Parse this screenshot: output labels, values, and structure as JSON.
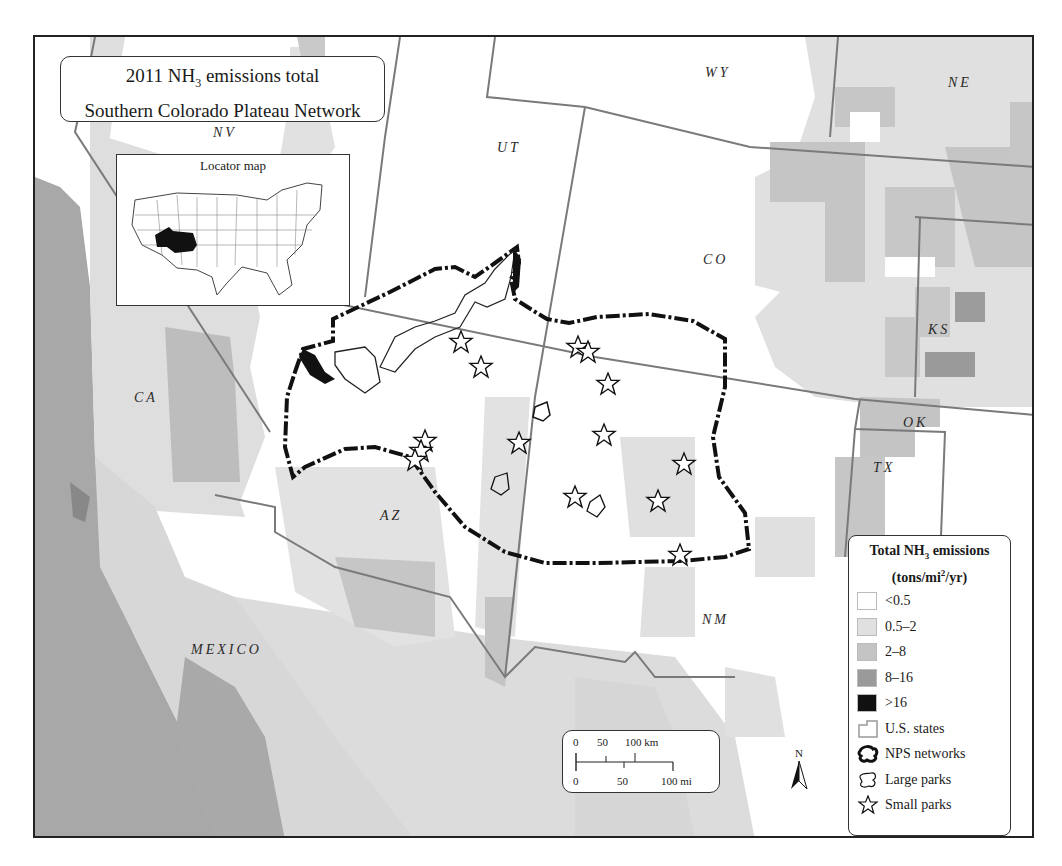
{
  "title": {
    "line1_prefix": "2011 NH",
    "line1_sub": "3",
    "line1_suffix": " emissions total",
    "line2": "Southern Colorado Plateau Network"
  },
  "locator": {
    "title": "Locator map"
  },
  "state_labels": {
    "nv": "NV",
    "ut": "UT",
    "wy": "WY",
    "ne": "NE",
    "co": "CO",
    "ks": "KS",
    "ok": "OK",
    "tx": "TX",
    "ca": "CA",
    "az": "AZ",
    "nm": "NM",
    "mexico": "MEXICO"
  },
  "legend": {
    "title_prefix": "Total NH",
    "title_sub": "3",
    "title_suffix": " emissions",
    "units_prefix": "(tons/mi",
    "units_sup": "2",
    "units_suffix": "/yr)",
    "classes": [
      {
        "label": "<0.5",
        "color": "#ffffff"
      },
      {
        "label": "0.5–2",
        "color": "#e0e0e0"
      },
      {
        "label": "2–8",
        "color": "#c4c4c4"
      },
      {
        "label": "8–16",
        "color": "#9a9a9a"
      },
      {
        "label": ">16",
        "color": "#111111"
      }
    ],
    "symbols": [
      {
        "label": "U.S. states",
        "icon": "state-outline-icon"
      },
      {
        "label": "NPS networks",
        "icon": "network-boundary-icon"
      },
      {
        "label": "Large parks",
        "icon": "large-park-outline-icon"
      },
      {
        "label": "Small parks",
        "icon": "star-icon"
      }
    ]
  },
  "scale_bar": {
    "km_ticks": [
      "0",
      "50",
      "100 km"
    ],
    "mi_ticks": [
      "0",
      "50",
      "100 mi"
    ]
  },
  "north_arrow": {
    "label": "N"
  },
  "colors": {
    "class_lt_0_5": "#ffffff",
    "class_0_5_2": "#e0e0e0",
    "class_2_8": "#c4c4c4",
    "class_8_16": "#9a9a9a",
    "class_gt_16": "#111111",
    "state_line": "#7a7a7a",
    "network_line": "#111111"
  },
  "small_parks": [
    {
      "x": 426,
      "y": 305
    },
    {
      "x": 446,
      "y": 330
    },
    {
      "x": 543,
      "y": 310
    },
    {
      "x": 553,
      "y": 315
    },
    {
      "x": 573,
      "y": 347
    },
    {
      "x": 390,
      "y": 404
    },
    {
      "x": 386,
      "y": 414
    },
    {
      "x": 380,
      "y": 423
    },
    {
      "x": 484,
      "y": 406
    },
    {
      "x": 569,
      "y": 398
    },
    {
      "x": 649,
      "y": 427
    },
    {
      "x": 540,
      "y": 460
    },
    {
      "x": 623,
      "y": 464
    },
    {
      "x": 645,
      "y": 518
    }
  ]
}
